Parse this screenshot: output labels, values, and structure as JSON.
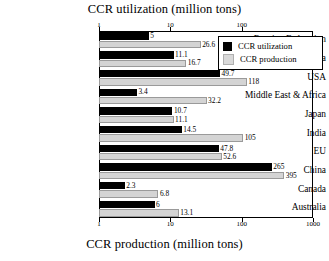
{
  "chart_data": {
    "type": "bar",
    "orientation": "horizontal",
    "title": "CCR utilization (million tons)",
    "xlabel_top": "CCR utilization (million tons)",
    "xlabel_bottom": "CCR production (million tons)",
    "ylabel": "",
    "xscale": "log",
    "xlim": [
      1,
      1000
    ],
    "grid": false,
    "legend_position": "top-right",
    "top_axis_ticks": [
      "1",
      "10",
      "100"
    ],
    "bottom_axis_ticks": [
      "1",
      "10",
      "100",
      "1000"
    ],
    "categories": [
      "Russian Federation",
      "Other Asia",
      "USA",
      "Middle East & Africa",
      "Japan",
      "India",
      "EU",
      "China",
      "Canada",
      "Australia"
    ],
    "series": [
      {
        "name": "CCR utilization",
        "color": "#000000",
        "values": [
          5,
          11.1,
          49.7,
          3.4,
          10.7,
          14.5,
          47.8,
          265,
          2.3,
          6
        ],
        "labels": [
          "5",
          "11.1",
          "49.7",
          "3.4",
          "10.7",
          "14.5",
          "47.8",
          "265",
          "2.3",
          "6"
        ]
      },
      {
        "name": "CCR production",
        "color": "#d4d4d4",
        "values": [
          26.6,
          16.7,
          118,
          32.2,
          11.1,
          105,
          52.6,
          395,
          6.8,
          13.1
        ],
        "labels": [
          "26.6",
          "16.7",
          "118",
          "32.2",
          "11.1",
          "105",
          "52.6",
          "395",
          "6.8",
          "13.1"
        ]
      }
    ]
  },
  "legend": {
    "items": [
      {
        "label": "CCR utilization",
        "swatch": "black-square-icon"
      },
      {
        "label": "CCR production",
        "swatch": "gray-square-icon"
      }
    ]
  }
}
